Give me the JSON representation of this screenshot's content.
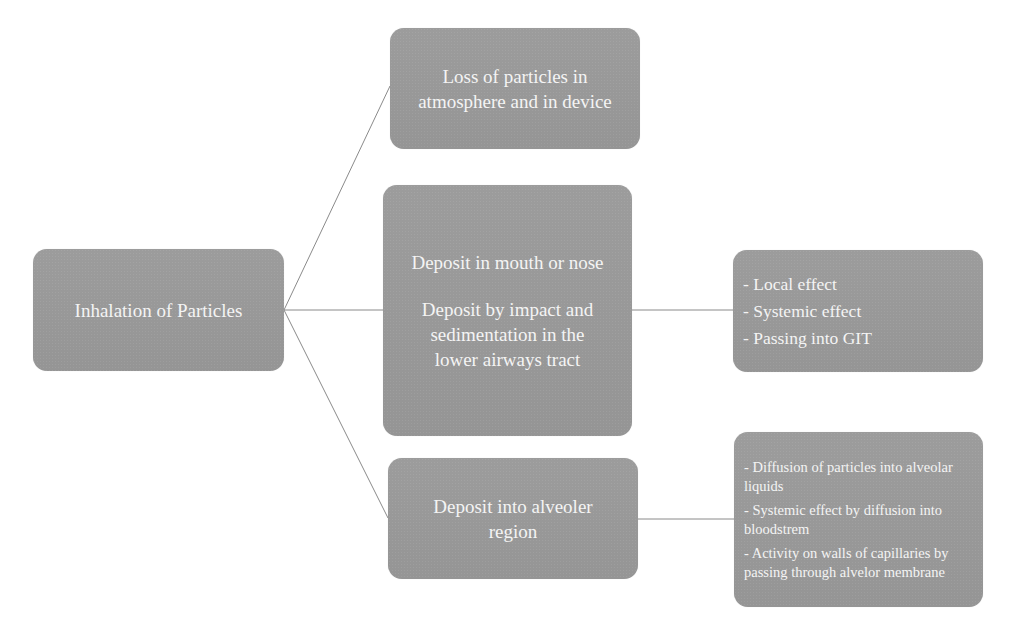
{
  "diagram": {
    "colors": {
      "node_fill": "#989898",
      "node_text": "#f4f4f4",
      "connector": "#8a8a8a",
      "background": "#ffffff"
    },
    "root": {
      "label": "Inhalation of Particles"
    },
    "branches": [
      {
        "label_lines": [
          "Loss of particles in",
          "atmosphere and in device"
        ]
      },
      {
        "paragraphs": [
          [
            "Deposit in mouth or nose"
          ],
          [
            "Deposit by impact and",
            "sedimentation in the",
            "lower airways tract"
          ]
        ],
        "outcomes": [
          "- Local effect",
          "- Systemic effect",
          "- Passing into GIT"
        ]
      },
      {
        "label_lines": [
          "Deposit into alveoler",
          "region"
        ],
        "outcomes": [
          "- Diffusion of particles into alveolar liquids",
          "- Systemic effect by diffusion into bloodstrem",
          "- Activity on walls of capillaries by passing through alvelor membrane"
        ]
      }
    ]
  }
}
